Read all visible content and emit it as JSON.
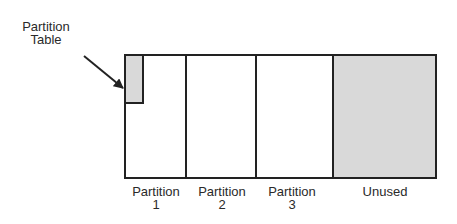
{
  "callout": {
    "line1": "Partition",
    "line2": "Table"
  },
  "partitions": [
    {
      "line1": "Partition",
      "line2": "1",
      "fill": "#ffffff"
    },
    {
      "line1": "Partition",
      "line2": "2",
      "fill": "#ffffff"
    },
    {
      "line1": "Partition",
      "line2": "3",
      "fill": "#ffffff"
    },
    {
      "line1": "Unused",
      "line2": "",
      "fill": "#d9d9d9"
    }
  ],
  "colors": {
    "stroke": "#222222",
    "shade": "#d9d9d9"
  }
}
